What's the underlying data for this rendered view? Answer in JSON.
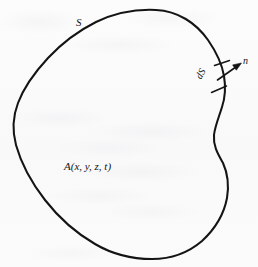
{
  "figure": {
    "type": "vector-calculus-closed-surface-diagram",
    "background_color": "#fbfbfb",
    "ink_color": "#141414",
    "labels": {
      "surface": "S",
      "normal": "n",
      "element": "dS",
      "field": "A(x, y, z, t)"
    },
    "annotations": {
      "surface_label_note": "label for the closed boundary curve",
      "normal_label_note": "outward unit normal at dS",
      "element_label_note": "differential element of the surface",
      "field_label_note": "vector field evaluated inside the volume"
    },
    "geometry": {
      "outline_leftmost_x": 14,
      "outline_rightmost_x": 228,
      "outline_topmost_y": 10,
      "outline_bottommost_y": 259,
      "stroke_width": 2.0,
      "tick_marks": 2,
      "normal_arrow": {
        "tail_x": 218,
        "tail_y": 80,
        "head_x": 241,
        "head_y": 64
      }
    }
  }
}
